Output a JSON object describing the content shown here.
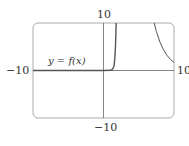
{
  "chart_data": {
    "type": "line",
    "title": "",
    "xlabel": "",
    "ylabel": "",
    "xlim": [
      -10,
      10
    ],
    "ylim": [
      -10,
      10
    ],
    "grid": false,
    "legend": null,
    "tick_labels": {
      "x_min": "−10",
      "x_max": "10",
      "y_min": "−10",
      "y_max": "10"
    },
    "annotations": [
      {
        "text": "y = f(x)",
        "x": -5.5,
        "y": 1.5
      }
    ],
    "series": [
      {
        "name": "y = f(x) (left branch)",
        "x": [
          -10,
          -5,
          0,
          1,
          1.3,
          1.5,
          1.6,
          1.7,
          1.75,
          1.8
        ],
        "y": [
          0,
          0,
          0,
          0.05,
          0.3,
          1,
          2.5,
          5,
          7.5,
          10
        ]
      },
      {
        "name": "y = f(x) (right branch)",
        "x": [
          7.2,
          7.5,
          8,
          8.5,
          9,
          9.5,
          10
        ],
        "y": [
          10,
          8.2,
          6.0,
          4.4,
          3.2,
          2.3,
          1.7
        ]
      }
    ],
    "colors": {
      "curve": "#555555",
      "axes": "#555555",
      "frame": "#999999"
    }
  }
}
